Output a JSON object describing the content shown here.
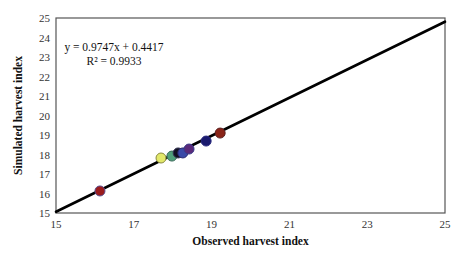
{
  "chart_data": {
    "type": "scatter",
    "title": "",
    "xlabel": "Observed harvest index",
    "ylabel": "Simulated harvest index",
    "xlim": [
      15,
      25
    ],
    "ylim": [
      15,
      25
    ],
    "x_ticks": [
      15,
      17,
      19,
      21,
      23,
      25
    ],
    "y_ticks": [
      15,
      16,
      17,
      18,
      19,
      20,
      21,
      22,
      23,
      24,
      25
    ],
    "grid": false,
    "legend": null,
    "points": [
      {
        "x": 16.13,
        "y": 16.13,
        "color": "#9b1c1c",
        "edge": "#5a4a8a"
      },
      {
        "x": 17.7,
        "y": 17.82,
        "color": "#e2e86a",
        "edge": "#8a8a40"
      },
      {
        "x": 17.98,
        "y": 17.92,
        "color": "#4fa07a",
        "edge": "#3a6a5a"
      },
      {
        "x": 18.14,
        "y": 18.08,
        "color": "#111122",
        "edge": "#333355"
      },
      {
        "x": 18.26,
        "y": 18.08,
        "color": "#3a4aa8",
        "edge": "#2a2a70"
      },
      {
        "x": 18.42,
        "y": 18.28,
        "color": "#5a2a7a",
        "edge": "#3a3a8a"
      },
      {
        "x": 18.86,
        "y": 18.69,
        "color": "#1a1a6e",
        "edge": "#2a2a80"
      },
      {
        "x": 19.22,
        "y": 19.1,
        "color": "#8a2418",
        "edge": "#5a2020"
      }
    ],
    "trendline": {
      "slope": 0.9747,
      "intercept": 0.4417,
      "r2": 0.9933,
      "x_range": [
        15,
        25
      ]
    },
    "annotations": {
      "equation": "y = 0.9747x + 0.4417",
      "r_squared": "R² = 0.9933"
    }
  }
}
